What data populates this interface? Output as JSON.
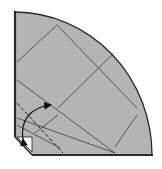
{
  "diagram": {
    "type": "origami-fold-diagram",
    "colors": {
      "background": "#ffffff",
      "paper_fill": "#b4b4b4",
      "outline": "#2a2a2a",
      "crease": "#4a4a4a",
      "corner_flap": "#ffffff"
    },
    "elements": [
      "quarter-circle paper shape",
      "crease lines",
      "dashed valley fold line",
      "curved fold arrow",
      "folded corner flap"
    ]
  }
}
